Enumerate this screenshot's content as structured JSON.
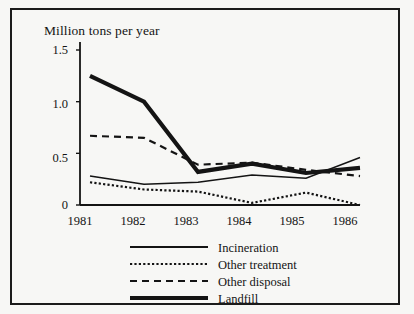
{
  "chart_data": {
    "type": "line",
    "title": "Million tons per year",
    "xlabel": "",
    "ylabel": "Million tons per year",
    "categories": [
      "1981",
      "1982",
      "1983",
      "1984",
      "1985",
      "1986"
    ],
    "x": [
      1981,
      1982,
      1983,
      1984,
      1985,
      1986
    ],
    "xlim": [
      1981,
      1986
    ],
    "ylim": [
      0,
      1.5
    ],
    "yticks": [
      "0",
      "0.5",
      "1.0",
      "1.5"
    ],
    "ytick_values": [
      0,
      0.5,
      1.0,
      1.5
    ],
    "grid": false,
    "legend_position": "bottom",
    "series": [
      {
        "name": "Incineration",
        "style": "solid-thin",
        "values": [
          0.28,
          0.2,
          0.22,
          0.29,
          0.26,
          0.46
        ]
      },
      {
        "name": "Other treatment",
        "style": "dotted",
        "values": [
          0.22,
          0.15,
          0.13,
          0.02,
          0.12,
          0.0
        ]
      },
      {
        "name": "Other disposal",
        "style": "dashed",
        "values": [
          0.67,
          0.65,
          0.39,
          0.41,
          0.34,
          0.28
        ]
      },
      {
        "name": "Landfill",
        "style": "solid-thick",
        "values": [
          1.25,
          1.0,
          0.32,
          0.4,
          0.31,
          0.36
        ]
      }
    ]
  },
  "legend": {
    "items": [
      {
        "label": "Incineration"
      },
      {
        "label": "Other treatment"
      },
      {
        "label": "Other disposal"
      },
      {
        "label": "Landfill"
      }
    ]
  },
  "colors": {
    "ink": "#141414",
    "background": "#f7f7f5"
  }
}
